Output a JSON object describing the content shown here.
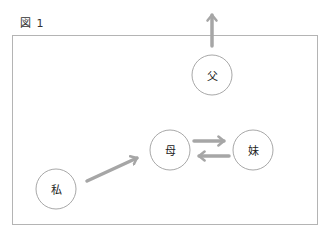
{
  "figure": {
    "label": "図 1"
  },
  "colors": {
    "frame": "#b4b4b4",
    "node_stroke": "#a8a8a8",
    "arrow": "#a6a6a6",
    "text": "#222222"
  },
  "nodes": [
    {
      "id": "father",
      "label": "父",
      "cx": 212,
      "cy": 75,
      "r": 20
    },
    {
      "id": "mother",
      "label": "母",
      "cx": 170,
      "cy": 150,
      "r": 20
    },
    {
      "id": "sister",
      "label": "妹",
      "cx": 253,
      "cy": 150,
      "r": 20
    },
    {
      "id": "me",
      "label": "私",
      "cx": 56,
      "cy": 189,
      "r": 20
    }
  ],
  "edges": [
    {
      "from": "father",
      "to": "outside-top",
      "direction": "up"
    },
    {
      "from": "me",
      "to": "mother"
    },
    {
      "from": "mother",
      "to": "sister"
    },
    {
      "from": "sister",
      "to": "mother"
    }
  ]
}
